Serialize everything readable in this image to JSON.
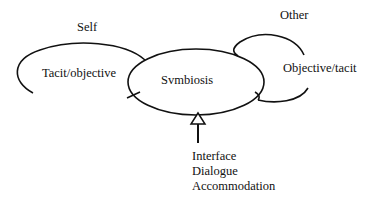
{
  "diagram": {
    "left_node": {
      "heading": "Self",
      "label": "Tacit/objective"
    },
    "center_node": {
      "label": "Svmbiosis"
    },
    "right_node": {
      "heading": "Other",
      "label": "Objective/tacit"
    },
    "arrow_labels": [
      "Interface",
      "Dialogue",
      "Accommodation"
    ],
    "colors": {
      "stroke": "#111111",
      "background": "#ffffff"
    }
  }
}
